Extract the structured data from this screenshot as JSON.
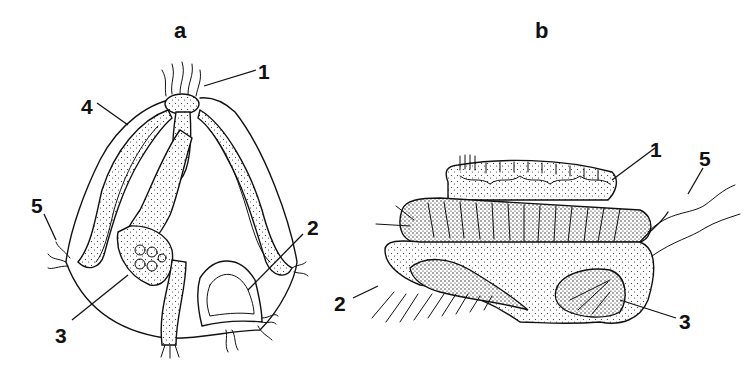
{
  "figure": {
    "panels": [
      {
        "id": "a",
        "title": "a",
        "callouts": [
          {
            "label": "1",
            "x": 258,
            "y": 61
          },
          {
            "label": "4",
            "x": 81,
            "y": 96
          },
          {
            "label": "5",
            "x": 31,
            "y": 195
          },
          {
            "label": "2",
            "x": 307,
            "y": 217
          },
          {
            "label": "3",
            "x": 55,
            "y": 325
          }
        ]
      },
      {
        "id": "b",
        "title": "b",
        "callouts": [
          {
            "label": "1",
            "x": 650,
            "y": 139
          },
          {
            "label": "5",
            "x": 699,
            "y": 148
          },
          {
            "label": "2",
            "x": 334,
            "y": 293
          },
          {
            "label": "3",
            "x": 679,
            "y": 311
          }
        ]
      }
    ]
  }
}
